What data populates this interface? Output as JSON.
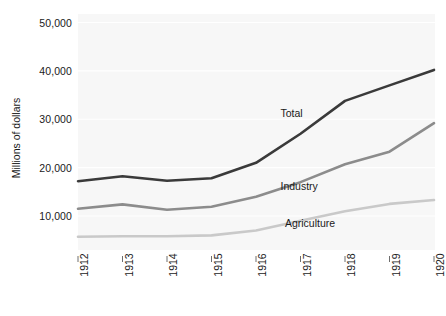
{
  "chart_data": {
    "type": "line",
    "title": "",
    "xlabel": "",
    "ylabel": "Millions of dollars",
    "categories": [
      "1912",
      "1913",
      "1914",
      "1915",
      "1916",
      "1917",
      "1918",
      "1919",
      "1920"
    ],
    "x": [
      1912,
      1913,
      1914,
      1915,
      1916,
      1917,
      1918,
      1919,
      1920
    ],
    "xlim": [
      1912,
      1920
    ],
    "ylim": [
      0,
      52000
    ],
    "yticks": [
      10000,
      20000,
      30000,
      40000,
      50000
    ],
    "ytick_labels": [
      "10,000",
      "20,000",
      "30,000",
      "40,000",
      "50,000"
    ],
    "grid": true,
    "legend": "inline-annotations",
    "series": [
      {
        "name": "Total",
        "color": "#3a3a3a",
        "values": [
          17200,
          18200,
          17300,
          17800,
          21000,
          27000,
          33800,
          37000,
          40200
        ]
      },
      {
        "name": "Industry",
        "color": "#8c8c8c",
        "values": [
          11500,
          12400,
          11300,
          11900,
          14000,
          17000,
          20700,
          23300,
          29200
        ]
      },
      {
        "name": "Agriculture",
        "color": "#c9c9c9",
        "values": [
          5700,
          5800,
          5800,
          6000,
          7000,
          9000,
          11000,
          12500,
          13300
        ]
      }
    ],
    "annotations": [
      {
        "text": "Total",
        "x": 1917.0,
        "y": 31000
      },
      {
        "text": "Industry",
        "x": 1917.0,
        "y": 16000
      },
      {
        "text": "Agriculture",
        "x": 1917.1,
        "y": 8300
      }
    ]
  },
  "style": {
    "panel_background": "#f7f7f7",
    "grid_color": "#ffffff",
    "axis_text_color": "#1a1a1a",
    "tick_color": "#6e6e6e"
  }
}
